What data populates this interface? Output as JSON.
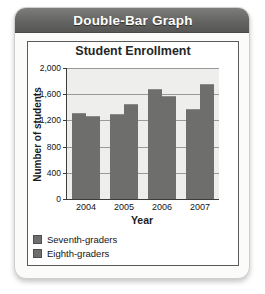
{
  "banner": {
    "title": "Double-Bar Graph"
  },
  "figure": {
    "chart_title": "Student Enrollment"
  },
  "chart_data": {
    "type": "bar",
    "title": "Student Enrollment",
    "xlabel": "Year",
    "ylabel": "Number of students",
    "categories": [
      "2004",
      "2005",
      "2006",
      "2007"
    ],
    "series": [
      {
        "name": "Seventh-graders",
        "values": [
          1300,
          1280,
          1670,
          1360
        ],
        "color": "#6e6e6c"
      },
      {
        "name": "Eighth-graders",
        "values": [
          1250,
          1440,
          1560,
          1740
        ],
        "color": "#6e6e6c"
      }
    ],
    "ylim": [
      0,
      2000
    ],
    "yticks": [
      "0",
      "400",
      "800",
      "1,200",
      "1,600",
      "2,000"
    ],
    "ytick_values": [
      0,
      400,
      800,
      1200,
      1600,
      2000
    ],
    "grid": true,
    "legend_position": "below-left"
  }
}
